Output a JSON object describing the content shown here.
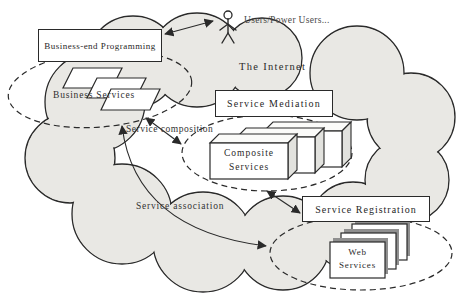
{
  "diagram": {
    "internet_label": "The Internet",
    "actor_label": "Users/Power Users...",
    "boxes": {
      "business_end_programming": "Business-end Programming",
      "service_mediation": "Service Mediation",
      "service_registration": "Service Registration"
    },
    "groups": {
      "business_services_label": "Business Services",
      "composite_services_line1": "Composite",
      "composite_services_line2": "Services",
      "web_services_line1": "Web",
      "web_services_line2": "Services"
    },
    "relations": {
      "service_composition": "Service composition",
      "service_association": "Service association"
    },
    "colors": {
      "cloud_fill": "#e9e8e4",
      "line": "#2a2a2a",
      "box_fill": "#ffffff",
      "card_shadow": "#8f8f8f",
      "cuboid_side": "#e2e2de"
    }
  }
}
